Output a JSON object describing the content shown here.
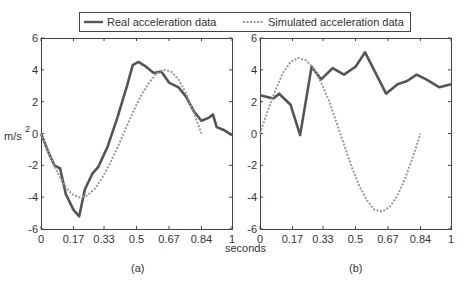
{
  "legend": {
    "real_label": "Real acceleration data",
    "sim_label": "Simulated acceleration data"
  },
  "colors": {
    "real": "#555555",
    "simulated": "#999999",
    "axes": "#444444"
  },
  "xlabel": "seconds",
  "ylabel": "m/s",
  "ylabel_sup": "2",
  "chart_data": [
    {
      "type": "line",
      "panel_label": "(a)",
      "title": "",
      "xlabel": "seconds",
      "ylabel": "m/s^2",
      "xlim": [
        0,
        1
      ],
      "ylim": [
        -6,
        6
      ],
      "xticks": [
        0,
        0.17,
        0.33,
        0.5,
        0.67,
        0.84,
        1
      ],
      "xtick_labels": [
        "0",
        "0.17",
        "0.33",
        "0.5",
        "0.67",
        "0.84",
        "1"
      ],
      "yticks": [
        -6,
        -4,
        -2,
        0,
        2,
        4,
        6
      ],
      "ytick_labels": [
        "-6",
        "-4",
        "-2",
        "0",
        "2",
        "4",
        "6"
      ],
      "grid": false,
      "legend_position": "top, shared across panels",
      "series": [
        {
          "name": "Real acceleration data",
          "style": "solid",
          "x": [
            0,
            0.04,
            0.07,
            0.1,
            0.13,
            0.17,
            0.2,
            0.23,
            0.27,
            0.3,
            0.35,
            0.4,
            0.45,
            0.48,
            0.51,
            0.55,
            0.59,
            0.63,
            0.67,
            0.72,
            0.76,
            0.8,
            0.84,
            0.88,
            0.9,
            0.92,
            0.96,
            1.0
          ],
          "y": [
            0,
            -1.2,
            -2.0,
            -2.2,
            -3.8,
            -4.8,
            -5.2,
            -3.5,
            -2.5,
            -2.1,
            -0.8,
            1.0,
            3.0,
            4.3,
            4.5,
            4.2,
            3.8,
            3.9,
            3.2,
            2.9,
            2.3,
            1.4,
            0.8,
            1.0,
            1.2,
            0.4,
            0.2,
            -0.1
          ]
        },
        {
          "name": "Simulated acceleration data",
          "style": "dotted",
          "x": [
            0,
            0.04,
            0.08,
            0.12,
            0.16,
            0.2,
            0.24,
            0.28,
            0.32,
            0.36,
            0.4,
            0.44,
            0.48,
            0.52,
            0.56,
            0.6,
            0.64,
            0.68,
            0.72,
            0.76,
            0.8,
            0.84
          ],
          "y": [
            0,
            -1.2,
            -2.3,
            -3.2,
            -3.8,
            -4.0,
            -3.9,
            -3.5,
            -2.8,
            -1.9,
            -0.9,
            0.2,
            1.3,
            2.3,
            3.1,
            3.7,
            4.0,
            3.9,
            3.4,
            2.5,
            1.3,
            0
          ]
        }
      ]
    },
    {
      "type": "line",
      "panel_label": "(b)",
      "title": "",
      "xlabel": "seconds",
      "ylabel": "m/s^2",
      "xlim": [
        0,
        1
      ],
      "ylim": [
        -6,
        6
      ],
      "xticks": [
        0,
        0.17,
        0.33,
        0.5,
        0.67,
        0.84,
        1
      ],
      "xtick_labels": [
        "0",
        "0.17",
        "0.33",
        "0.5",
        "0.67",
        "0.84",
        "1"
      ],
      "yticks": [
        -6,
        -4,
        -2,
        0,
        2,
        4,
        6
      ],
      "ytick_labels": [
        "-6",
        "-4",
        "-2",
        "0",
        "2",
        "4",
        "6"
      ],
      "grid": false,
      "series": [
        {
          "name": "Real acceleration data",
          "style": "solid",
          "x": [
            0,
            0.07,
            0.1,
            0.16,
            0.21,
            0.27,
            0.32,
            0.38,
            0.44,
            0.5,
            0.55,
            0.66,
            0.72,
            0.77,
            0.82,
            0.87,
            0.94,
            1.0
          ],
          "y": [
            2.4,
            2.2,
            2.5,
            1.8,
            -0.1,
            4.2,
            3.4,
            4.1,
            3.7,
            4.2,
            5.1,
            2.5,
            3.1,
            3.3,
            3.7,
            3.4,
            2.9,
            3.1
          ]
        },
        {
          "name": "Simulated acceleration data",
          "style": "dotted",
          "x": [
            0,
            0.04,
            0.08,
            0.12,
            0.16,
            0.2,
            0.24,
            0.28,
            0.32,
            0.36,
            0.4,
            0.44,
            0.48,
            0.52,
            0.56,
            0.6,
            0.64,
            0.68,
            0.72,
            0.76,
            0.8,
            0.84
          ],
          "y": [
            0,
            1.4,
            2.7,
            3.8,
            4.5,
            4.75,
            4.6,
            4.1,
            3.2,
            2.1,
            0.7,
            -0.7,
            -2.1,
            -3.3,
            -4.2,
            -4.8,
            -4.9,
            -4.6,
            -3.9,
            -2.8,
            -1.5,
            0
          ]
        }
      ]
    }
  ]
}
